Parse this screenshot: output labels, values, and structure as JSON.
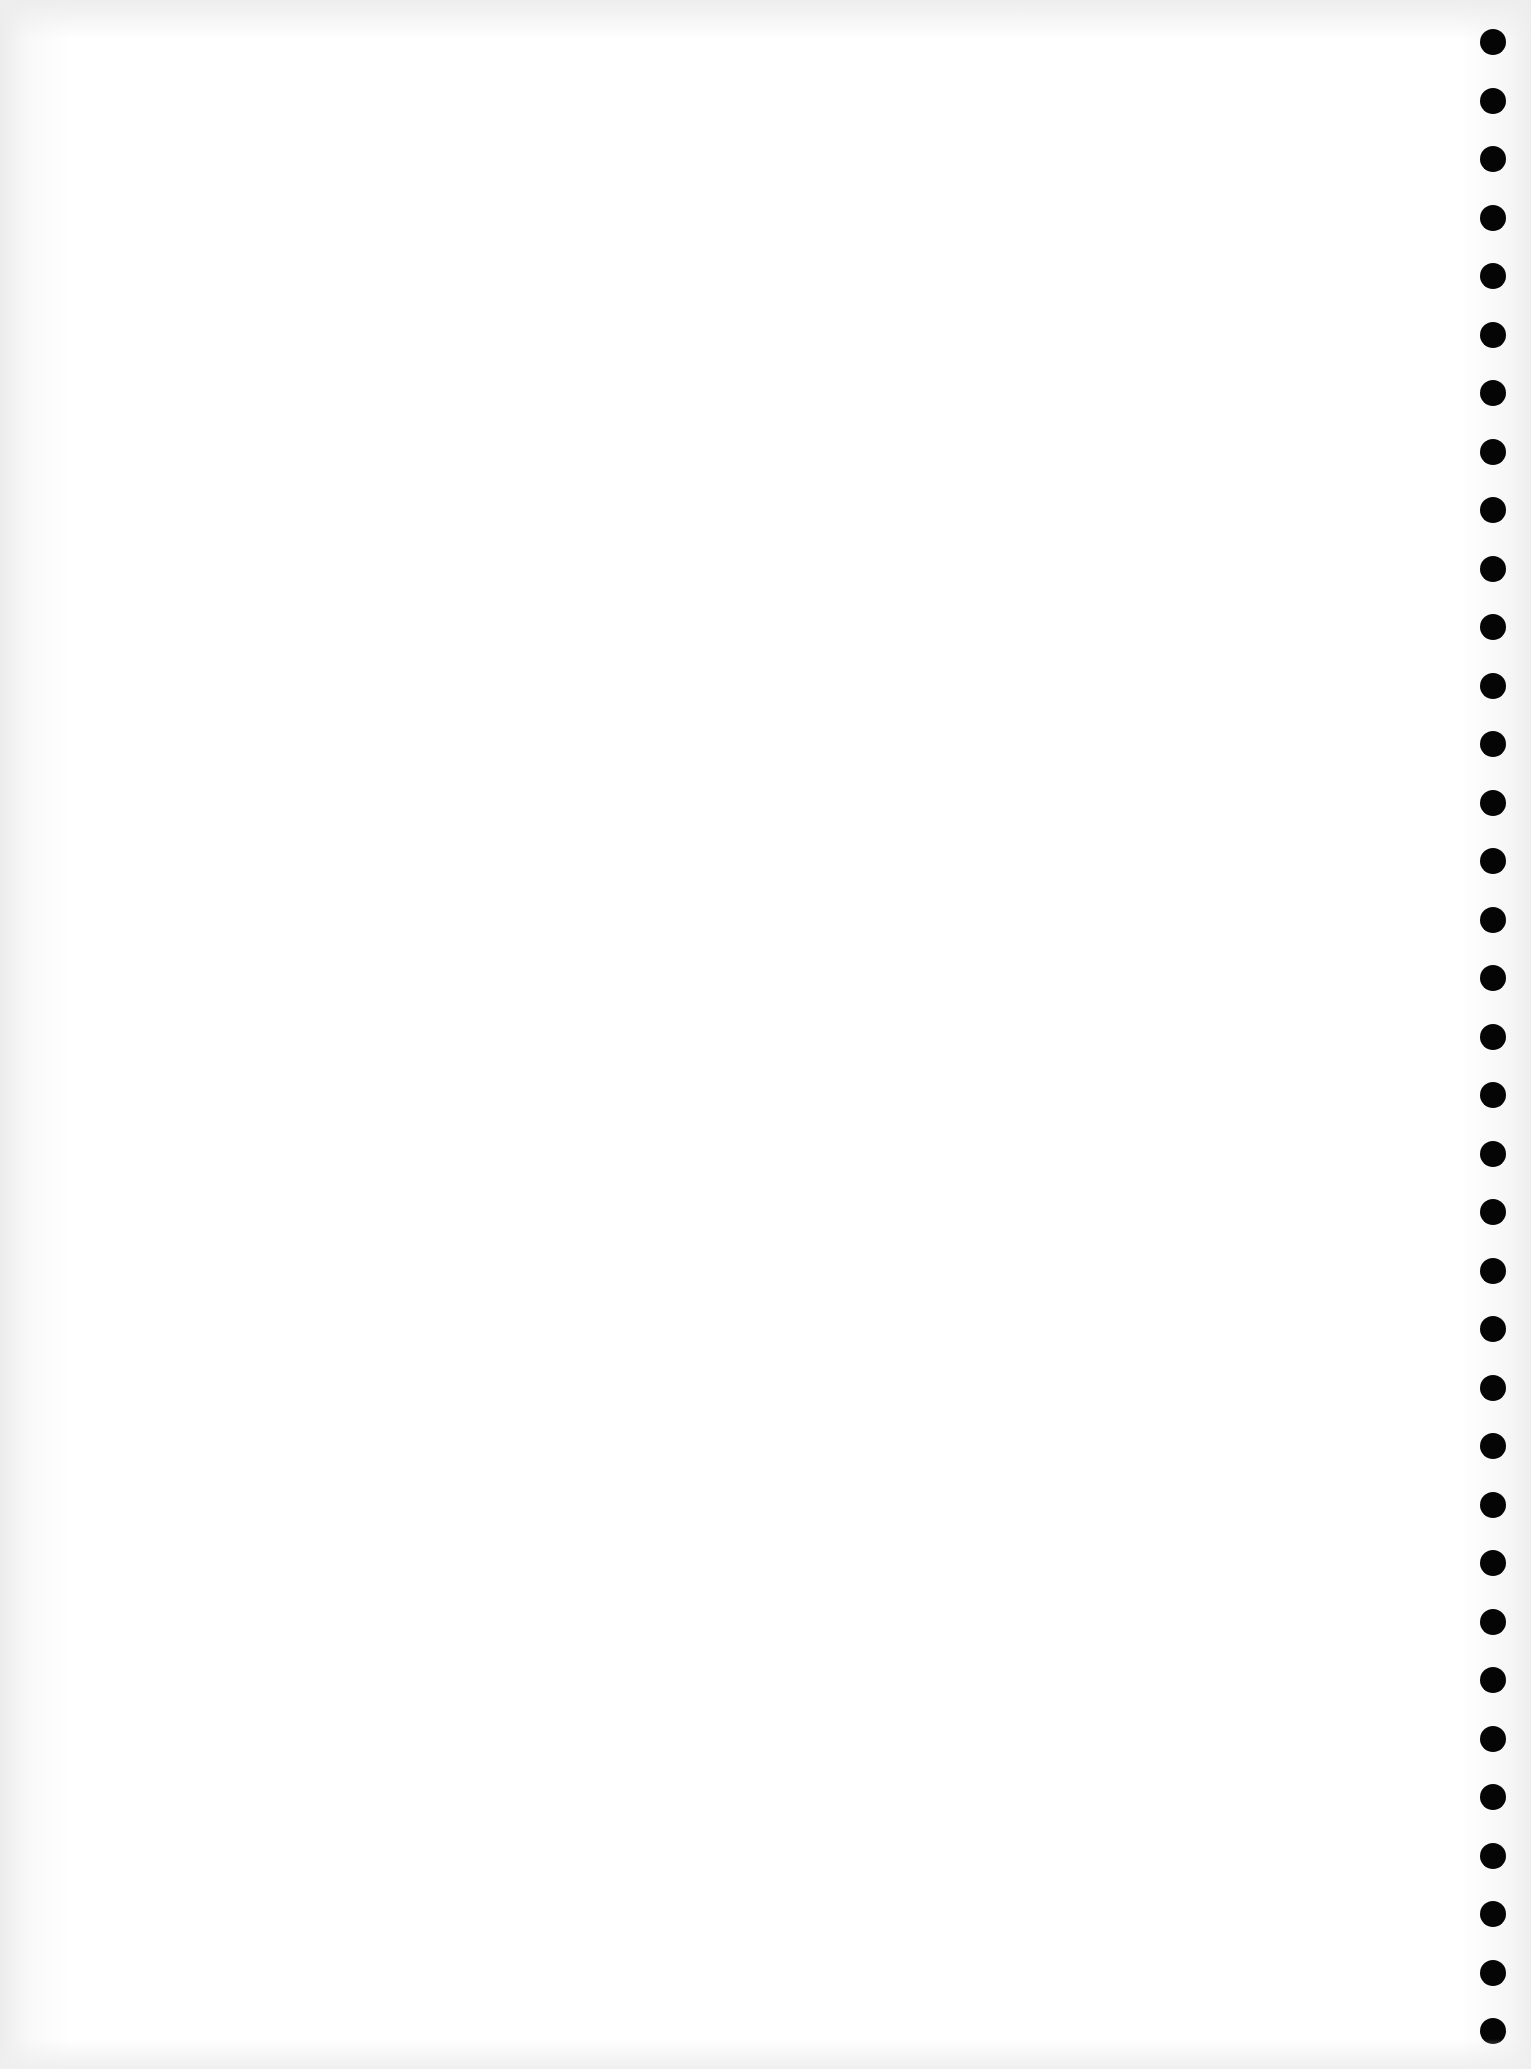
{
  "document": {
    "type": "blank scanned page",
    "text": "",
    "background_color": "#ffffff",
    "perforation": {
      "side": "right",
      "count": 35,
      "color": "#050505",
      "diameter_px": 26,
      "spacing_px": 58.5
    }
  }
}
